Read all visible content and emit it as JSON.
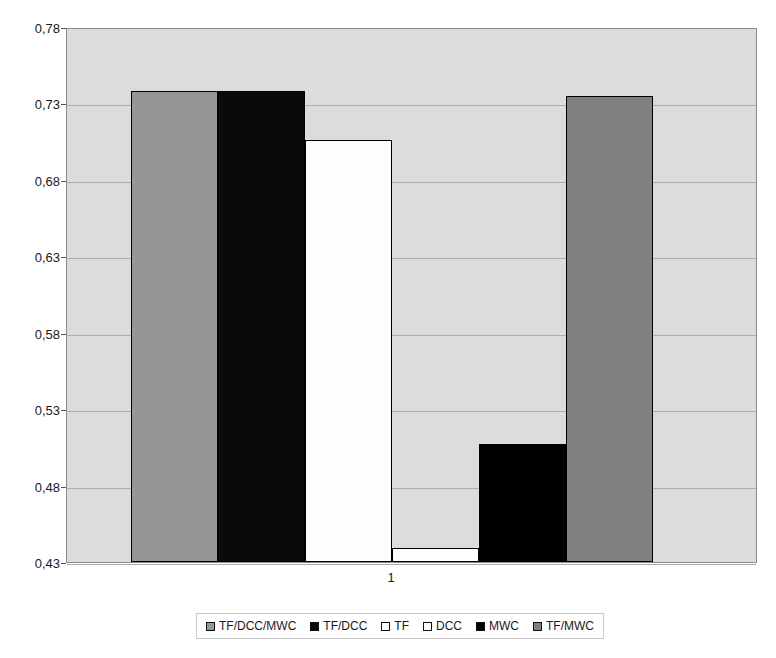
{
  "chart_data": {
    "type": "bar",
    "title": "",
    "subtitle": "",
    "xlabel": "",
    "ylabel": "",
    "categories": [
      "1"
    ],
    "x_tick_labels": [
      "1"
    ],
    "y_tick_labels": [
      "0,78",
      "0,73",
      "0,68",
      "0,63",
      "0,58",
      "0,53",
      "0,48",
      "0,43"
    ],
    "y_tick_values": [
      0.78,
      0.73,
      0.68,
      0.63,
      0.58,
      0.53,
      0.48,
      0.43
    ],
    "ylim": [
      0.43,
      0.78
    ],
    "grid": true,
    "legend_position": "bottom",
    "series": [
      {
        "name": "TF/DCC/MWC",
        "values": [
          0.738
        ],
        "color": "#969696"
      },
      {
        "name": "TF/DCC",
        "values": [
          0.738
        ],
        "color": "#0a0a0a"
      },
      {
        "name": "TF",
        "values": [
          0.706
        ],
        "color": "#fdfdfd"
      },
      {
        "name": "DCC",
        "values": [
          0.439
        ],
        "color": "#fdfdfd"
      },
      {
        "name": "MWC",
        "values": [
          0.507
        ],
        "color": "#000000"
      },
      {
        "name": "TF/MWC",
        "values": [
          0.735
        ],
        "color": "#808080"
      }
    ]
  },
  "style": {
    "plot_background": "#dcdcdc",
    "gridline_color": "#adadad",
    "axis_color": "#8c8c8c",
    "bar_border": "#000000",
    "page_background": "#ffffff",
    "text_color": "#1a1a1a"
  }
}
